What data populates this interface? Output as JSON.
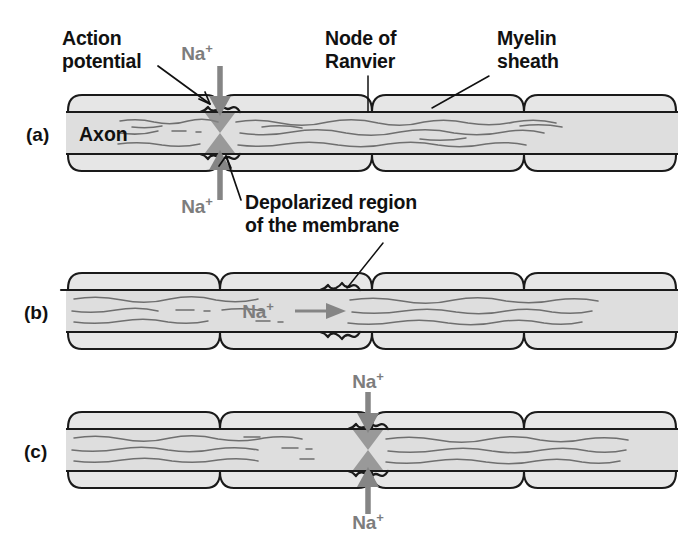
{
  "figure": {
    "background_color": "#ffffff",
    "myelin_fill": "#e6e6e6",
    "axon_fill": "#dedede",
    "outline_color": "#1a1a1a",
    "ion_color": "#858585",
    "text_color": "#111111"
  },
  "labels": {
    "action_potential_line1": "Action",
    "action_potential_line2": "potential",
    "node_of_ranvier_line1": "Node of",
    "node_of_ranvier_line2": "Ranvier",
    "myelin_sheath_line1": "Myelin",
    "myelin_sheath_line2": "sheath",
    "depolarized_line1": "Depolarized region",
    "depolarized_line2": "of the membrane",
    "axon": "Axon",
    "sodium_ion": "Na",
    "sodium_charge": "+"
  },
  "panels": [
    {
      "id": "a",
      "letter": "(a)",
      "active_node_index": 1,
      "ion_labels": [
        "Na+",
        "Na+"
      ],
      "ion_arrow_direction": "vertical-inward",
      "segment_count": 4
    },
    {
      "id": "b",
      "letter": "(b)",
      "active_node_index": 3,
      "ion_labels": [
        "Na+"
      ],
      "ion_arrow_direction": "horizontal-right",
      "segment_count": 4
    },
    {
      "id": "c",
      "letter": "(c)",
      "active_node_index": 2,
      "ion_labels": [
        "Na+",
        "Na+"
      ],
      "ion_arrow_direction": "vertical-inward",
      "segment_count": 4
    }
  ],
  "callouts": [
    {
      "name": "action-potential",
      "target_panel": "a"
    },
    {
      "name": "node-of-ranvier",
      "target_panel": "a"
    },
    {
      "name": "myelin-sheath",
      "target_panel": "a"
    },
    {
      "name": "depolarized-region",
      "target_panel": "a"
    },
    {
      "name": "depolarized-region",
      "target_panel": "b"
    }
  ]
}
